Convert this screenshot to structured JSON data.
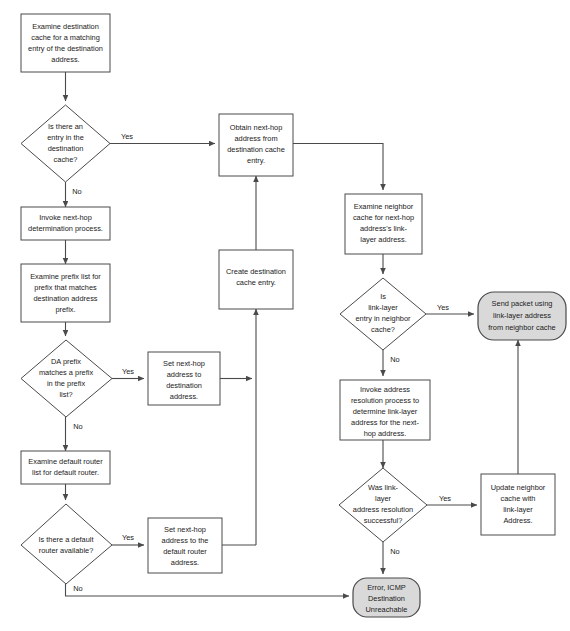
{
  "diagram": {
    "colors": {
      "background": "#ffffff",
      "node_fill": "#ffffff",
      "terminal_fill": "#d9d9d9",
      "stroke": "#4a4a4a",
      "text": "#1a1a1a"
    }
  },
  "nodes": [
    {
      "id": "examine-destination-cache",
      "type": "process",
      "lines": [
        "Examine destination",
        "cache for a matching",
        "entry of the destination",
        "address."
      ]
    },
    {
      "id": "is-there-entry-destination-cache",
      "type": "decision",
      "lines": [
        "Is there an",
        "entry in the",
        "destination",
        "cache?"
      ]
    },
    {
      "id": "obtain-next-hop-address",
      "type": "process",
      "lines": [
        "Obtain next-hop",
        "address from",
        "destination cache",
        "entry."
      ]
    },
    {
      "id": "invoke-next-hop-determination",
      "type": "process",
      "lines": [
        "Invoke next-hop",
        "determination process."
      ]
    },
    {
      "id": "examine-prefix-list",
      "type": "process",
      "lines": [
        "Examine prefix list for",
        "prefix that matches",
        "destination address",
        "prefix."
      ]
    },
    {
      "id": "da-prefix-matches",
      "type": "decision",
      "lines": [
        "DA prefix",
        "matches a prefix",
        "in the prefix",
        "list?"
      ]
    },
    {
      "id": "set-next-hop-destination",
      "type": "process",
      "lines": [
        "Set next-hop",
        "address to",
        "destination",
        "address."
      ]
    },
    {
      "id": "create-destination-cache-entry",
      "type": "process",
      "lines": [
        "Create destination",
        "cache entry."
      ]
    },
    {
      "id": "examine-default-router-list",
      "type": "process",
      "lines": [
        "Examine default router",
        "list for default router."
      ]
    },
    {
      "id": "is-there-default-router",
      "type": "decision",
      "lines": [
        "Is there a default",
        "router available?"
      ]
    },
    {
      "id": "set-next-hop-default-router",
      "type": "process",
      "lines": [
        "Set next-hop",
        "address to the",
        "default router",
        "address."
      ]
    },
    {
      "id": "examine-neighbor-cache",
      "type": "process",
      "lines": [
        "Examine neighbor",
        "cache for next-hop",
        "address's link-",
        "layer address."
      ]
    },
    {
      "id": "is-link-layer-entry-in-neighbor-cache",
      "type": "decision",
      "lines": [
        "Is",
        "link-layer",
        "entry in neighbor",
        "cache?"
      ]
    },
    {
      "id": "send-packet",
      "type": "terminal",
      "lines": [
        "Send packet using",
        "link-layer address",
        "from neighbor cache"
      ]
    },
    {
      "id": "invoke-address-resolution",
      "type": "process",
      "lines": [
        "Invoke address",
        "resolution process to",
        "determine link-layer",
        "address for the next-",
        "hop address."
      ]
    },
    {
      "id": "was-address-resolution-successful",
      "type": "decision",
      "lines": [
        "Was link-",
        "layer",
        "address resolution",
        "successful?"
      ]
    },
    {
      "id": "update-neighbor-cache",
      "type": "process",
      "lines": [
        "Update neighbor",
        "cache with",
        "link-layer",
        "Address."
      ]
    },
    {
      "id": "error-icmp-destination-unreachable",
      "type": "terminal",
      "lines": [
        "Error, ICMP",
        "Destination",
        "Unreachable"
      ]
    }
  ],
  "edge_labels": {
    "dest_cache_yes": "Yes",
    "dest_cache_no": "No",
    "da_prefix_yes": "Yes",
    "da_prefix_no": "No",
    "default_router_yes": "Yes",
    "default_router_no": "No",
    "neighbor_cache_yes": "Yes",
    "neighbor_cache_no": "No",
    "resolution_yes": "Yes",
    "resolution_no": "No"
  }
}
